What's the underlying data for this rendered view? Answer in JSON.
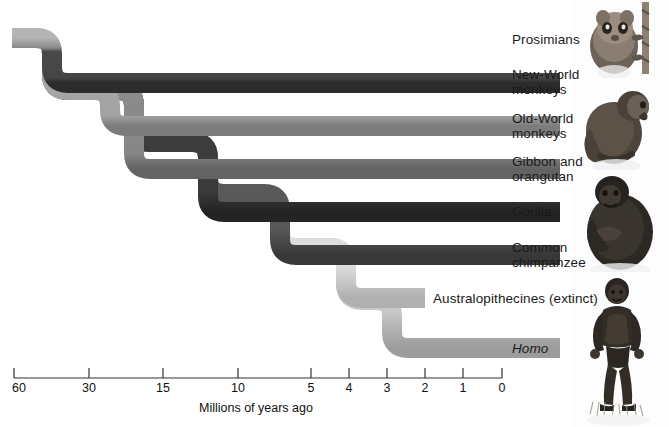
{
  "figure": {
    "type": "phylogenetic-tree",
    "axis_title": "Millions of years ago",
    "axis_ticks": [
      {
        "label": "60",
        "value": 60,
        "x": 14
      },
      {
        "label": "30",
        "value": 30,
        "x": 89
      },
      {
        "label": "15",
        "value": 15,
        "x": 163
      },
      {
        "label": "10",
        "value": 10,
        "x": 238
      },
      {
        "label": "5",
        "value": 5,
        "x": 311
      },
      {
        "label": "4",
        "value": 4,
        "x": 349
      },
      {
        "label": "3",
        "value": 3,
        "x": 387
      },
      {
        "label": "2",
        "value": 2,
        "x": 425
      },
      {
        "label": "1",
        "value": 1,
        "x": 463
      },
      {
        "label": "0",
        "value": 0,
        "x": 502
      }
    ],
    "axis_line_y": 378,
    "axis_start_x": 14,
    "axis_end_x": 502
  },
  "branches": [
    {
      "id": "prosimians",
      "label": "Prosimians",
      "color": "#4e4e4e",
      "highlight": "#9a9a9a",
      "bar_y": 30,
      "label_x": 512,
      "label_y": 33,
      "split_x": 60,
      "divergence_mya": 55
    },
    {
      "id": "new-world-monkeys",
      "label": "New-World\nmonkeys",
      "color": "#4a4a4a",
      "highlight": "#8f8f8f",
      "bar_y": 73,
      "label_x": 512,
      "label_y": 68,
      "split_x": 110,
      "divergence_mya": 38
    },
    {
      "id": "old-world-monkeys",
      "label": "Old-World\nmonkeys",
      "color": "#a9a9a9",
      "highlight": "#d2d2d2",
      "bar_y": 116,
      "label_x": 512,
      "label_y": 111,
      "split_x": 152,
      "divergence_mya": 25
    },
    {
      "id": "gibbon-and-orangutan",
      "label": "Gibbon and\norangutan",
      "color": "#8d8d8d",
      "highlight": "#bdbdbd",
      "bar_y": 159,
      "label_x": 512,
      "label_y": 154,
      "split_x": 222,
      "divergence_mya": 12
    },
    {
      "id": "gorilla",
      "label": "Gorilla",
      "color": "#3f3f3f",
      "highlight": "#8a8a8a",
      "bar_y": 202,
      "label_x": 512,
      "label_y": 205,
      "split_x": 272,
      "divergence_mya": 7
    },
    {
      "id": "common-chimpanzee",
      "label": "Common\nchimpanzee",
      "color": "#5e5e5e",
      "highlight": "#a0a0a0",
      "bar_y": 245,
      "label_x": 512,
      "label_y": 240,
      "split_x": 330,
      "divergence_mya": 4
    },
    {
      "id": "australopithecines",
      "label": "Australopithecines (extinct)",
      "color": "#e2e2e2",
      "highlight": "#f2f2f2",
      "bar_y": 288,
      "label_x": 433,
      "label_y": 291,
      "split_x": 388,
      "divergence_mya": 2.5,
      "terminates_x": 425,
      "extinct": true
    },
    {
      "id": "homo",
      "label": "Homo",
      "color": "#cfcfcf",
      "highlight": "#e9e9e9",
      "bar_y": 338,
      "label_x": 512,
      "label_y": 341,
      "italic": true,
      "divergence_mya": 2
    }
  ],
  "photos": [
    {
      "id": "prosimian-photo",
      "alt": "prosimian-lemur",
      "top": 0,
      "height": 78
    },
    {
      "id": "monkey-photo",
      "alt": "old-world-monkey",
      "top": 78,
      "height": 92
    },
    {
      "id": "gorilla-photo",
      "alt": "gorilla",
      "top": 170,
      "height": 105
    },
    {
      "id": "hominid-photo",
      "alt": "hominid",
      "top": 272,
      "height": 155
    }
  ],
  "colors": {
    "root": "#4e4e4e",
    "background": "#ffffff",
    "text": "#1a1a1a",
    "axis": "#333333"
  }
}
